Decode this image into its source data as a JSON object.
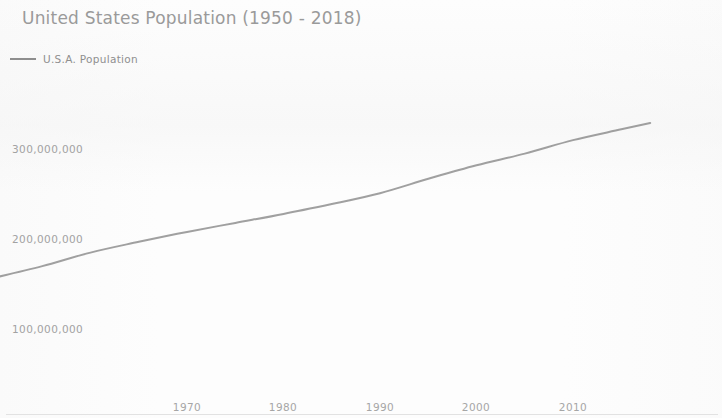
{
  "chart_data": {
    "type": "line",
    "title": "United States Population (1950 - 2018)",
    "xlabel": "",
    "ylabel": "",
    "grid": false,
    "legend_position": "top-left",
    "xlim": [
      1950,
      2018
    ],
    "ylim": [
      0,
      350000000
    ],
    "x_ticks": [
      "1970",
      "1980",
      "1990",
      "2000",
      "2010"
    ],
    "x_tick_values": [
      1970,
      1980,
      1990,
      2000,
      2010
    ],
    "y_ticks": [
      "100,000,000",
      "200,000,000",
      "300,000,000"
    ],
    "y_tick_values": [
      100000000,
      200000000,
      300000000
    ],
    "series": [
      {
        "name": "U.S.A. Population",
        "color": "#8b8b8b",
        "x": [
          1950,
          1955,
          1960,
          1965,
          1970,
          1975,
          1980,
          1985,
          1990,
          1995,
          2000,
          2005,
          2010,
          2015,
          2018
        ],
        "values": [
          158000000,
          171000000,
          186000000,
          198000000,
          209000000,
          219000000,
          229000000,
          240000000,
          252000000,
          268000000,
          283000000,
          296000000,
          311000000,
          323000000,
          330000000
        ]
      }
    ]
  },
  "legend": {
    "marker_icon": "line-marker-icon",
    "label": "U.S.A. Population"
  },
  "axis": {
    "y_ticks": [
      {
        "label": "300,000,000",
        "top_px": 143
      },
      {
        "label": "200,000,000",
        "top_px": 233
      },
      {
        "label": "100,000,000",
        "top_px": 323
      }
    ],
    "x_ticks": [
      {
        "label": "1970",
        "left_px": 187
      },
      {
        "label": "1980",
        "left_px": 283
      },
      {
        "label": "1990",
        "left_px": 380
      },
      {
        "label": "2000",
        "left_px": 476
      },
      {
        "label": "2010",
        "left_px": 573
      }
    ]
  },
  "colors": {
    "line": "#8b8b8b",
    "title": "#9a9a9a",
    "tick_text": "#a2a2a2",
    "axis_rule": "#e2e2e2",
    "background": "#fdfdfd"
  },
  "line_path": "M 5 266 C 40 258, 70 248, 96 241 C 125 233, 155 228, 188 223 C 250 212, 300 199, 352 186 C 400 174, 450 160, 482 152 C 520 142, 560 131, 610 122 C 655 114, 690 110, 711 108"
}
